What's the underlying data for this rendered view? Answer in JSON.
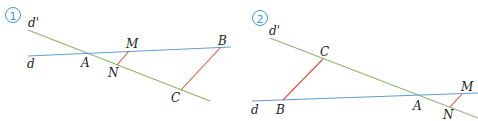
{
  "colors": {
    "line_d": "#5b9fd6",
    "line_d_prime": "#8ab56a",
    "segment": "#e0503c",
    "label": "#222222",
    "badge": "#3a9ad9"
  },
  "figures": [
    {
      "number": "1",
      "labels": {
        "d_prime": "d'",
        "d": "d",
        "A": "A",
        "M": "M",
        "N": "N",
        "B": "B",
        "C": "C"
      }
    },
    {
      "number": "2",
      "labels": {
        "d_prime": "d'",
        "d": "d",
        "A": "A",
        "M": "M",
        "N": "N",
        "B": "B",
        "C": "C"
      }
    }
  ]
}
